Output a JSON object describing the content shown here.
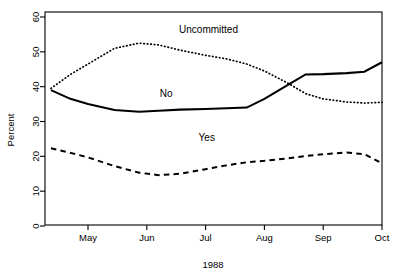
{
  "chart_data": {
    "type": "line",
    "title": "",
    "xlabel": "1988",
    "ylabel": "Percent",
    "ylim": [
      0,
      60
    ],
    "yticks": [
      0,
      10,
      20,
      30,
      40,
      50,
      60
    ],
    "xticks": [
      "May",
      "Jun",
      "Jul",
      "Aug",
      "Sep",
      "Oct"
    ],
    "grid": false,
    "legend_position": "inline-annotations",
    "x_unit": "month-index (May=1 ... Oct=6)",
    "x": [
      0.37,
      0.7,
      1.0,
      1.45,
      1.87,
      2.2,
      2.56,
      3.0,
      3.35,
      3.7,
      4.0,
      4.4,
      4.7,
      5.0,
      5.4,
      5.7,
      6.0
    ],
    "series": [
      {
        "name": "Uncommitted",
        "style": "dotted",
        "values": [
          39.5,
          43.5,
          46.5,
          51.0,
          52.5,
          52.0,
          50.5,
          49.0,
          48.0,
          46.5,
          44.5,
          41.0,
          38.0,
          36.5,
          35.6,
          35.3,
          35.5
        ],
        "label": "Uncommitted",
        "label_x": 3.05,
        "label_y": 55.5
      },
      {
        "name": "No",
        "style": "solid",
        "values": [
          39.0,
          36.5,
          35.0,
          33.3,
          32.8,
          33.1,
          33.4,
          33.6,
          33.8,
          34.0,
          36.5,
          40.5,
          43.5,
          43.6,
          43.9,
          44.3,
          47.0
        ],
        "label": "No",
        "label_x": 2.33,
        "label_y": 37.0
      },
      {
        "name": "Yes",
        "style": "dashed",
        "values": [
          22.3,
          21.0,
          19.7,
          17.2,
          15.3,
          14.6,
          15.0,
          16.3,
          17.4,
          18.3,
          18.7,
          19.4,
          20.1,
          20.6,
          21.1,
          20.6,
          18.0
        ],
        "label": "Yes",
        "label_x": 3.02,
        "label_y": 24.5
      }
    ]
  },
  "axes": {
    "y_label": "Percent",
    "x_label": "1988",
    "y_tick_labels": [
      "0",
      "10",
      "20",
      "30",
      "40",
      "50",
      "60"
    ],
    "x_tick_labels": [
      "May",
      "Jun",
      "Jul",
      "Aug",
      "Sep",
      "Oct"
    ]
  }
}
